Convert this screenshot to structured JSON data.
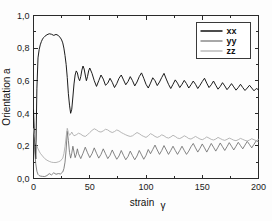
{
  "chart_data": {
    "type": "line",
    "title": "",
    "xlabel": "strain γ",
    "ylabel": "Orientation a",
    "xlim": [
      0,
      200
    ],
    "ylim": [
      0.0,
      1.0
    ],
    "xticks": [
      0,
      50,
      100,
      150,
      200
    ],
    "xticklabels": [
      "0",
      "50",
      "100",
      "150",
      "200"
    ],
    "yticks": [
      0.0,
      0.2,
      0.4,
      0.6,
      0.8,
      1.0
    ],
    "yticklabels": [
      "0,0",
      "0,2",
      "0,4",
      "0,6",
      "0,8",
      "1,0"
    ],
    "grid": false,
    "legend_position": "upper right",
    "legend_entries": [
      "xx",
      "yy",
      "zz"
    ],
    "colors": {
      "xx": "#111111",
      "yy": "#6e6e6e",
      "zz": "#a9a9a9"
    },
    "series": [
      {
        "name": "xx",
        "color": "#111111",
        "x": [
          0,
          1,
          2,
          3,
          4,
          5,
          6,
          7,
          8,
          9,
          10,
          12,
          14,
          16,
          18,
          20,
          22,
          24,
          25,
          26,
          27,
          28,
          29,
          30,
          31,
          32,
          33,
          34,
          35,
          36,
          37,
          38,
          39,
          40,
          41,
          42,
          43,
          44,
          45,
          46,
          47,
          48,
          49,
          50,
          52,
          54,
          56,
          58,
          60,
          62,
          64,
          66,
          68,
          70,
          72,
          74,
          76,
          78,
          80,
          82,
          84,
          86,
          88,
          90,
          92,
          94,
          96,
          98,
          100,
          102,
          104,
          106,
          108,
          110,
          112,
          114,
          116,
          118,
          120,
          122,
          124,
          126,
          128,
          130,
          132,
          134,
          136,
          138,
          140,
          142,
          144,
          146,
          148,
          150,
          152,
          154,
          156,
          158,
          160,
          162,
          164,
          166,
          168,
          170,
          172,
          174,
          176,
          178,
          180,
          182,
          184,
          186,
          188,
          190,
          192,
          194,
          196,
          198,
          200
        ],
        "y": [
          0.42,
          0.23,
          0.12,
          0.55,
          0.74,
          0.79,
          0.82,
          0.84,
          0.855,
          0.865,
          0.872,
          0.882,
          0.888,
          0.885,
          0.878,
          0.884,
          0.878,
          0.862,
          0.85,
          0.832,
          0.8,
          0.755,
          0.7,
          0.62,
          0.52,
          0.45,
          0.4,
          0.425,
          0.5,
          0.58,
          0.635,
          0.66,
          0.648,
          0.615,
          0.6,
          0.625,
          0.665,
          0.69,
          0.672,
          0.635,
          0.6,
          0.625,
          0.66,
          0.678,
          0.645,
          0.6,
          0.565,
          0.6,
          0.635,
          0.61,
          0.572,
          0.585,
          0.615,
          0.59,
          0.558,
          0.582,
          0.615,
          0.635,
          0.605,
          0.575,
          0.595,
          0.625,
          0.6,
          0.568,
          0.592,
          0.625,
          0.648,
          0.615,
          0.578,
          0.555,
          0.585,
          0.618,
          0.6,
          0.57,
          0.592,
          0.62,
          0.645,
          0.61,
          0.578,
          0.552,
          0.578,
          0.605,
          0.585,
          0.558,
          0.578,
          0.602,
          0.582,
          0.555,
          0.575,
          0.598,
          0.578,
          0.552,
          0.572,
          0.595,
          0.615,
          0.585,
          0.558,
          0.575,
          0.598,
          0.572,
          0.548,
          0.565,
          0.588,
          0.568,
          0.545,
          0.562,
          0.582,
          0.562,
          0.542,
          0.558,
          0.578,
          0.558,
          0.54,
          0.555,
          0.572,
          0.555,
          0.538,
          0.552,
          0.545
        ]
      },
      {
        "name": "yy",
        "color": "#6e6e6e",
        "x": [
          0,
          1,
          2,
          3,
          4,
          5,
          6,
          8,
          10,
          12,
          14,
          16,
          18,
          20,
          22,
          24,
          26,
          27,
          28,
          29,
          30,
          31,
          32,
          33,
          34,
          35,
          36,
          37,
          38,
          39,
          40,
          42,
          44,
          46,
          48,
          50,
          52,
          54,
          56,
          58,
          60,
          62,
          64,
          66,
          68,
          70,
          72,
          74,
          76,
          78,
          80,
          82,
          84,
          86,
          88,
          90,
          92,
          94,
          96,
          98,
          100,
          102,
          104,
          106,
          108,
          110,
          112,
          114,
          116,
          118,
          120,
          122,
          124,
          126,
          128,
          130,
          132,
          134,
          136,
          138,
          140,
          142,
          144,
          146,
          148,
          150,
          152,
          154,
          156,
          158,
          160,
          162,
          164,
          166,
          168,
          170,
          172,
          174,
          176,
          178,
          180,
          182,
          184,
          186,
          188,
          190,
          192,
          194,
          196,
          198,
          200
        ],
        "y": [
          0.3,
          0.18,
          0.09,
          0.045,
          0.025,
          0.018,
          0.015,
          0.013,
          0.012,
          0.018,
          0.03,
          0.022,
          0.035,
          0.026,
          0.03,
          0.028,
          0.04,
          0.06,
          0.1,
          0.175,
          0.29,
          0.232,
          0.16,
          0.125,
          0.155,
          0.198,
          0.162,
          0.128,
          0.148,
          0.182,
          0.152,
          0.122,
          0.155,
          0.192,
          0.158,
          0.128,
          0.152,
          0.188,
          0.155,
          0.125,
          0.148,
          0.182,
          0.152,
          0.122,
          0.142,
          0.175,
          0.145,
          0.118,
          0.138,
          0.172,
          0.142,
          0.115,
          0.135,
          0.168,
          0.14,
          0.115,
          0.138,
          0.172,
          0.145,
          0.118,
          0.142,
          0.178,
          0.152,
          0.178,
          0.205,
          0.175,
          0.148,
          0.172,
          0.202,
          0.175,
          0.148,
          0.172,
          0.198,
          0.172,
          0.148,
          0.172,
          0.198,
          0.172,
          0.148,
          0.168,
          0.195,
          0.215,
          0.188,
          0.162,
          0.185,
          0.212,
          0.188,
          0.162,
          0.188,
          0.215,
          0.192,
          0.168,
          0.192,
          0.218,
          0.195,
          0.172,
          0.195,
          0.22,
          0.198,
          0.175,
          0.198,
          0.222,
          0.202,
          0.182,
          0.205,
          0.228,
          0.208,
          0.188,
          0.21,
          0.232,
          0.225
        ]
      },
      {
        "name": "zz",
        "color": "#a9a9a9",
        "x": [
          0,
          1,
          2,
          3,
          4,
          5,
          6,
          8,
          10,
          12,
          14,
          16,
          18,
          20,
          22,
          24,
          26,
          27,
          28,
          29,
          30,
          31,
          32,
          33,
          34,
          35,
          36,
          38,
          40,
          42,
          44,
          46,
          48,
          50,
          52,
          54,
          56,
          58,
          60,
          62,
          64,
          66,
          68,
          70,
          72,
          74,
          76,
          78,
          80,
          82,
          84,
          86,
          88,
          90,
          92,
          94,
          96,
          98,
          100,
          102,
          104,
          106,
          108,
          110,
          112,
          114,
          116,
          118,
          120,
          122,
          124,
          126,
          128,
          130,
          132,
          134,
          136,
          138,
          140,
          142,
          144,
          146,
          148,
          150,
          152,
          154,
          156,
          158,
          160,
          162,
          164,
          166,
          168,
          170,
          172,
          174,
          176,
          178,
          180,
          182,
          184,
          186,
          188,
          190,
          192,
          194,
          196,
          198,
          200
        ],
        "y": [
          0.305,
          0.262,
          0.225,
          0.2,
          0.182,
          0.168,
          0.155,
          0.138,
          0.122,
          0.112,
          0.105,
          0.1,
          0.098,
          0.098,
          0.102,
          0.108,
          0.125,
          0.152,
          0.195,
          0.255,
          0.308,
          0.282,
          0.265,
          0.272,
          0.285,
          0.272,
          0.262,
          0.268,
          0.278,
          0.272,
          0.262,
          0.258,
          0.268,
          0.282,
          0.295,
          0.305,
          0.298,
          0.288,
          0.285,
          0.292,
          0.302,
          0.298,
          0.288,
          0.282,
          0.288,
          0.298,
          0.292,
          0.282,
          0.275,
          0.268,
          0.262,
          0.258,
          0.262,
          0.272,
          0.282,
          0.275,
          0.265,
          0.258,
          0.252,
          0.262,
          0.275,
          0.268,
          0.258,
          0.252,
          0.258,
          0.268,
          0.262,
          0.252,
          0.248,
          0.255,
          0.265,
          0.258,
          0.248,
          0.245,
          0.252,
          0.262,
          0.255,
          0.245,
          0.242,
          0.25,
          0.258,
          0.25,
          0.242,
          0.238,
          0.245,
          0.255,
          0.248,
          0.24,
          0.236,
          0.242,
          0.252,
          0.245,
          0.238,
          0.234,
          0.24,
          0.248,
          0.242,
          0.235,
          0.232,
          0.238,
          0.246,
          0.24,
          0.234,
          0.23,
          0.236,
          0.244,
          0.238,
          0.232,
          0.24
        ]
      }
    ]
  },
  "axes": {
    "y_label": "Orientation a",
    "x_label_main": "strain",
    "x_label_symbol": "γ"
  },
  "legend": {
    "items": [
      {
        "label": "xx",
        "color": "#111111"
      },
      {
        "label": "yy",
        "color": "#6e6e6e"
      },
      {
        "label": "zz",
        "color": "#a9a9a9"
      }
    ]
  }
}
